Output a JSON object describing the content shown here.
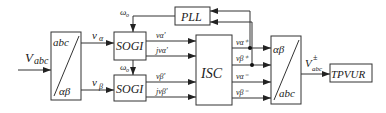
{
  "diagram": {
    "input": "V",
    "input_sub": "abc",
    "blocks": {
      "abc_to_ab": {
        "top": "abc",
        "bottom": "αβ"
      },
      "sogi_top": "SOGI",
      "sogi_bottom": "SOGI",
      "pll": "PLL",
      "isc": "ISC",
      "ab_to_abc": {
        "top": "αβ",
        "bottom": "abc"
      },
      "tpvur": "TPVUR"
    },
    "signals": {
      "v_alpha": "v",
      "v_alpha_sub": "α",
      "v_beta": "v",
      "v_beta_sub": "β",
      "omega_top": "ω",
      "omega_top_sub": "o",
      "omega_bottom": "ω",
      "omega_bottom_sub": "o",
      "sogi1_out1": "vα'",
      "sogi1_out2": "jvα'",
      "sogi2_out1": "vβ'",
      "sogi2_out2": "jvβ'",
      "isc_out1": "vα⁺",
      "isc_out2": "vβ⁺",
      "isc_out3": "vα⁻",
      "isc_out4": "vβ⁻",
      "output": "V",
      "output_sup": "±",
      "output_sub": "abc"
    }
  }
}
